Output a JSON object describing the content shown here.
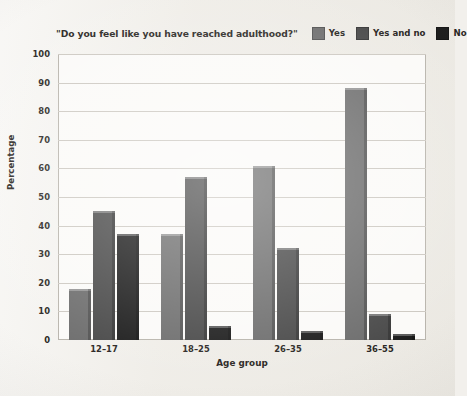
{
  "chart_data": {
    "type": "bar",
    "title": "\"Do you feel like you have reached adulthood?\"",
    "xlabel": "Age group",
    "ylabel": "Percentage",
    "categories": [
      "12–17",
      "18–25",
      "26–35",
      "36–55"
    ],
    "series": [
      {
        "name": "Yes",
        "values": [
          18,
          37,
          61,
          88
        ],
        "color": "#6e6e6e"
      },
      {
        "name": "Yes and no",
        "values": [
          45,
          57,
          32,
          9
        ],
        "color": "#4a4a4a"
      },
      {
        "name": "No",
        "values": [
          37,
          5,
          3,
          2
        ],
        "color": "#1e1e1e"
      }
    ],
    "ylim": [
      0,
      100
    ],
    "yticks": [
      0,
      10,
      20,
      30,
      40,
      50,
      60,
      70,
      80,
      90,
      100
    ],
    "grid": true,
    "legend_position": "top-right"
  },
  "colors": {
    "page_background": "#f0eee9",
    "plot_background": "#fbfaf8",
    "gridline": "#cdc9c2",
    "axis_border": "#b9b5ad",
    "text": "#2a2724"
  }
}
